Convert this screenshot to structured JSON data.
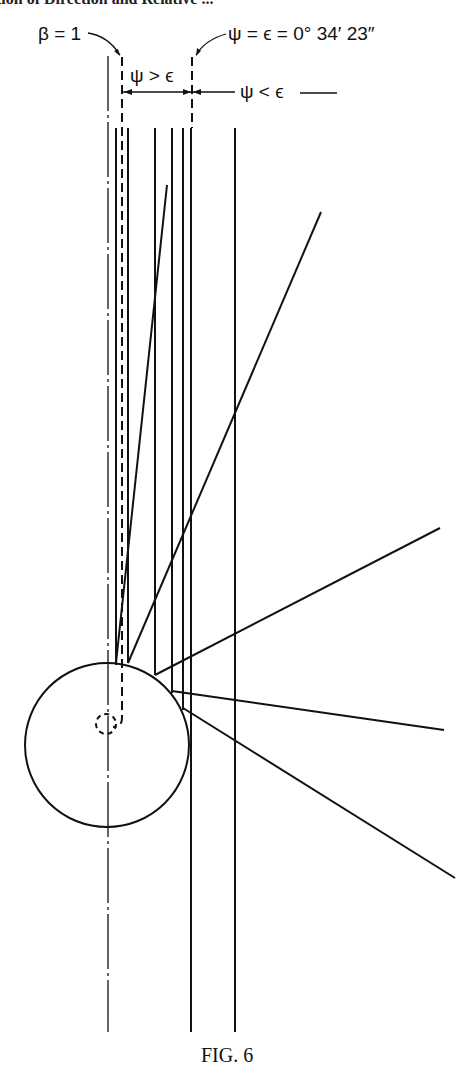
{
  "header_fragment": "tion of Direction and Relative ...",
  "labels": {
    "beta": "β = 1",
    "psi_eq": "ψ = ϵ = 0° 34′ 23″",
    "psi_gt": "ψ > ϵ",
    "psi_lt": "ψ < ϵ"
  },
  "caption": "FIG. 6",
  "colors": {
    "ink": "#111111",
    "background": "#ffffff"
  }
}
